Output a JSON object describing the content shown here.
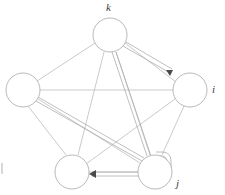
{
  "figure": {
    "type": "graph-diagram",
    "title": "",
    "background_color": "#ffffff",
    "edge_color": "#b9b9b9",
    "highlight_edge_color": "#a8a8a8",
    "node_stroke_color": "#b0b0b0",
    "node_fill_color": "#ffffff",
    "label_color": "#3b3b3b",
    "arrow_color": "#4a4a4a"
  },
  "nodes": [
    {
      "id": "k",
      "name": "node-k",
      "label": "k",
      "cx": 110,
      "cy": 35,
      "r": 17,
      "label_x": 106,
      "label_y": 2,
      "label_visible": true
    },
    {
      "id": "i",
      "name": "node-i",
      "label": "i",
      "cx": 190,
      "cy": 90,
      "r": 17,
      "label_x": 212,
      "label_y": 84,
      "label_visible": true
    },
    {
      "id": "j",
      "name": "node-j",
      "label": "j",
      "cx": 155,
      "cy": 172,
      "r": 17,
      "label_x": 176,
      "label_y": 178,
      "label_visible": true
    },
    {
      "id": "l",
      "name": "node-bottom-left",
      "label": "",
      "cx": 72,
      "cy": 172,
      "r": 17,
      "label_x": 0,
      "label_y": 0,
      "label_visible": false
    },
    {
      "id": "m",
      "name": "node-left",
      "label": "",
      "cx": 23,
      "cy": 90,
      "r": 17,
      "label_x": 0,
      "label_y": 0,
      "label_visible": false
    }
  ],
  "edges": [
    {
      "name": "edge-k-i",
      "from": "k",
      "to": "i",
      "style": "plain"
    },
    {
      "name": "edge-k-m",
      "from": "k",
      "to": "m",
      "style": "plain"
    },
    {
      "name": "edge-k-j",
      "from": "k",
      "to": "j",
      "style": "plain"
    },
    {
      "name": "edge-k-l",
      "from": "k",
      "to": "l",
      "style": "plain"
    },
    {
      "name": "edge-i-m",
      "from": "i",
      "to": "m",
      "style": "plain"
    },
    {
      "name": "edge-i-j",
      "from": "i",
      "to": "j",
      "style": "plain"
    },
    {
      "name": "edge-i-l",
      "from": "i",
      "to": "l",
      "style": "plain"
    },
    {
      "name": "edge-m-j",
      "from": "m",
      "to": "j",
      "style": "plain"
    },
    {
      "name": "edge-m-l",
      "from": "m",
      "to": "l",
      "style": "plain"
    },
    {
      "name": "edge-j-l",
      "from": "j",
      "to": "l",
      "style": "plain"
    }
  ],
  "directed_paths": [
    {
      "name": "path-k-to-i",
      "from": "k",
      "to": "i",
      "arrow": true,
      "note": "double line from top node to right node"
    },
    {
      "name": "path-m-to-j",
      "from": "m",
      "to": "j",
      "arrow": false,
      "note": "double line from left node to bottom-right node"
    },
    {
      "name": "path-k-to-j",
      "from": "k",
      "to": "j",
      "arrow": false,
      "note": "double line from top node down to bottom-right node"
    },
    {
      "name": "path-j-to-l",
      "from": "j",
      "to": "l",
      "arrow": true,
      "note": "rounded double line from bottom-right node to bottom-left node"
    }
  ],
  "edge_label": {
    "left_mark_visible": true
  }
}
